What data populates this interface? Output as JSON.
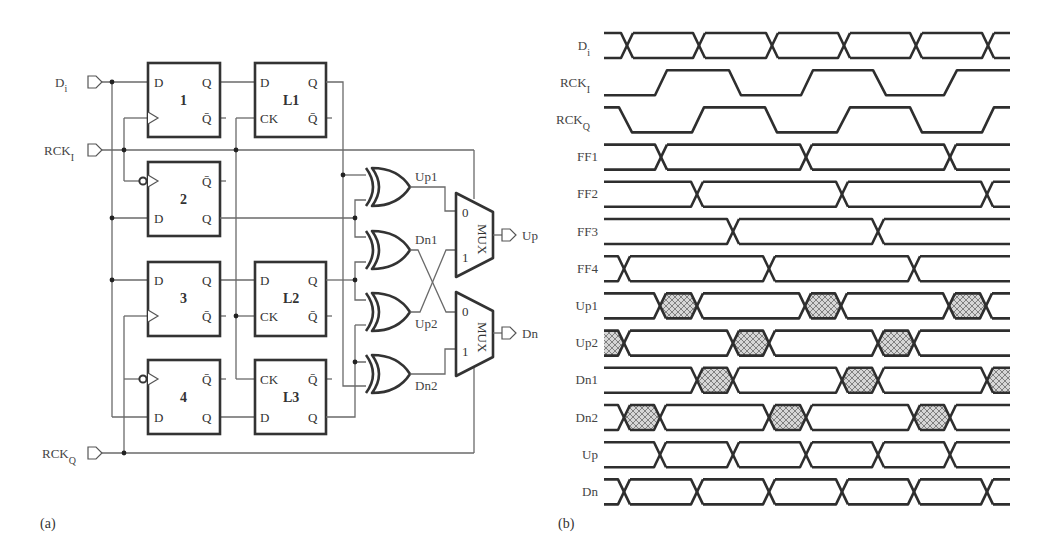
{
  "figure": {
    "panel_a_caption": "(a)",
    "panel_b_caption": "(b)"
  },
  "circuit": {
    "inputs": [
      {
        "name": "D",
        "sub": "i",
        "y": 82
      },
      {
        "name": "RCK",
        "sub": "I",
        "y": 150
      },
      {
        "name": "RCK",
        "sub": "Q",
        "y": 453
      }
    ],
    "flipflops": [
      {
        "id": "1",
        "x": 148,
        "y": 63,
        "top_left": "D",
        "top_right": "Q",
        "bot_right": "Q̄",
        "clock": "rising"
      },
      {
        "id": "2",
        "x": 148,
        "y": 162,
        "top_right": "Q̄",
        "bot_left": "D",
        "bot_right": "Q",
        "clock": "inverted"
      },
      {
        "id": "3",
        "x": 148,
        "y": 262,
        "top_left": "D",
        "top_right": "Q",
        "bot_right": "Q̄",
        "clock": "rising"
      },
      {
        "id": "4",
        "x": 148,
        "y": 360,
        "top_right": "Q̄",
        "bot_left": "D",
        "bot_right": "Q",
        "clock": "inverted"
      }
    ],
    "latches": [
      {
        "id": "L1",
        "x": 255,
        "y": 63,
        "top_left": "D",
        "top_right": "Q",
        "bot_left": "CK",
        "bot_right": "Q̄"
      },
      {
        "id": "L2",
        "x": 255,
        "y": 262,
        "top_left": "D",
        "top_right": "Q",
        "bot_left": "CK",
        "bot_right": "Q̄"
      },
      {
        "id": "L3",
        "x": 255,
        "y": 360,
        "top_left": "CK",
        "top_right": "Q̄",
        "bot_left": "D",
        "bot_right": "Q"
      }
    ],
    "xor_outputs": [
      "Up1",
      "Dn1",
      "Up2",
      "Dn2"
    ],
    "muxes": [
      {
        "label": "MUX",
        "in0": "0",
        "in1": "1",
        "output": "Up"
      },
      {
        "label": "MUX",
        "in0": "0",
        "in1": "1",
        "output": "Dn"
      }
    ]
  },
  "timing": {
    "x_start": 604,
    "x_end": 1010,
    "signals": [
      {
        "name": "D",
        "sub": "i",
        "type": "bus",
        "crossings": [
          627,
          699,
          772,
          844,
          916,
          988
        ],
        "hatched": []
      },
      {
        "name": "RCK",
        "sub": "I",
        "type": "clock",
        "start": "low",
        "edges": [
          [
            655,
            667
          ],
          [
            729,
            741
          ],
          [
            801,
            813
          ],
          [
            873,
            886
          ],
          [
            944,
            957
          ]
        ]
      },
      {
        "name": "RCK",
        "sub": "Q",
        "type": "clock",
        "start": "high",
        "edges": [
          [
            619,
            632
          ],
          [
            692,
            704
          ],
          [
            765,
            777
          ],
          [
            837,
            850
          ],
          [
            910,
            922
          ],
          [
            982,
            994
          ]
        ]
      },
      {
        "name": "FF1",
        "sub": "",
        "type": "bus",
        "crossings": [
          661,
          806,
          950
        ],
        "hatched": []
      },
      {
        "name": "FF2",
        "sub": "",
        "type": "bus",
        "crossings": [
          697,
          842,
          987
        ],
        "hatched": []
      },
      {
        "name": "FF3",
        "sub": "",
        "type": "bus",
        "crossings": [
          733,
          878
        ],
        "hatched": []
      },
      {
        "name": "FF4",
        "sub": "",
        "type": "bus",
        "crossings": [
          624,
          769,
          914
        ],
        "hatched": []
      },
      {
        "name": "Up1",
        "sub": "",
        "type": "bus",
        "crossings": [
          660,
          697,
          805,
          841,
          949,
          986
        ],
        "hatched": [
          [
            660,
            697
          ],
          [
            805,
            841
          ],
          [
            949,
            986
          ]
        ]
      },
      {
        "name": "Up2",
        "sub": "",
        "type": "bus",
        "crossings": [
          624,
          733,
          769,
          878,
          914
        ],
        "hatched": [
          [
            604,
            624
          ],
          [
            733,
            769
          ],
          [
            878,
            914
          ]
        ]
      },
      {
        "name": "Dn1",
        "sub": "",
        "type": "bus",
        "crossings": [
          697,
          733,
          842,
          878,
          987
        ],
        "hatched": [
          [
            697,
            733
          ],
          [
            842,
            878
          ],
          [
            987,
            1010
          ]
        ]
      },
      {
        "name": "Dn2",
        "sub": "",
        "type": "bus",
        "crossings": [
          624,
          660,
          769,
          806,
          914,
          950
        ],
        "hatched": [
          [
            624,
            660
          ],
          [
            769,
            806
          ],
          [
            914,
            950
          ]
        ]
      },
      {
        "name": "Up",
        "sub": "",
        "type": "bus",
        "crossings": [
          660,
          733,
          806,
          878,
          950
        ],
        "hatched": []
      },
      {
        "name": "Dn",
        "sub": "",
        "type": "bus",
        "crossings": [
          624,
          697,
          769,
          842,
          914,
          987
        ],
        "hatched": []
      }
    ]
  }
}
